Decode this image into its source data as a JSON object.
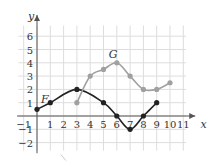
{
  "chart_data": {
    "type": "line",
    "title": "",
    "xlabel": "x",
    "ylabel": "y",
    "xlim": [
      -1,
      11
    ],
    "ylim": [
      -2,
      6
    ],
    "x_ticks": [
      "-1",
      "1",
      "2",
      "3",
      "4",
      "5",
      "6",
      "7",
      "8",
      "9",
      "10",
      "11"
    ],
    "y_ticks": [
      "6",
      "5",
      "4",
      "3",
      "2",
      "1",
      "-1",
      "-2"
    ],
    "grid": true,
    "series": [
      {
        "name": "F",
        "color": "#222222",
        "points": [
          [
            0,
            0.5
          ],
          [
            1,
            1
          ],
          [
            3,
            2
          ],
          [
            5,
            1
          ],
          [
            6,
            0
          ],
          [
            7,
            -1
          ],
          [
            8,
            0
          ],
          [
            9,
            1
          ]
        ]
      },
      {
        "name": "G",
        "color": "#a0a0a0",
        "points": [
          [
            3,
            1
          ],
          [
            4,
            3
          ],
          [
            5,
            3.5
          ],
          [
            6,
            4
          ],
          [
            7,
            3
          ],
          [
            8,
            2
          ],
          [
            9,
            2
          ],
          [
            10,
            2.5
          ]
        ]
      }
    ]
  }
}
